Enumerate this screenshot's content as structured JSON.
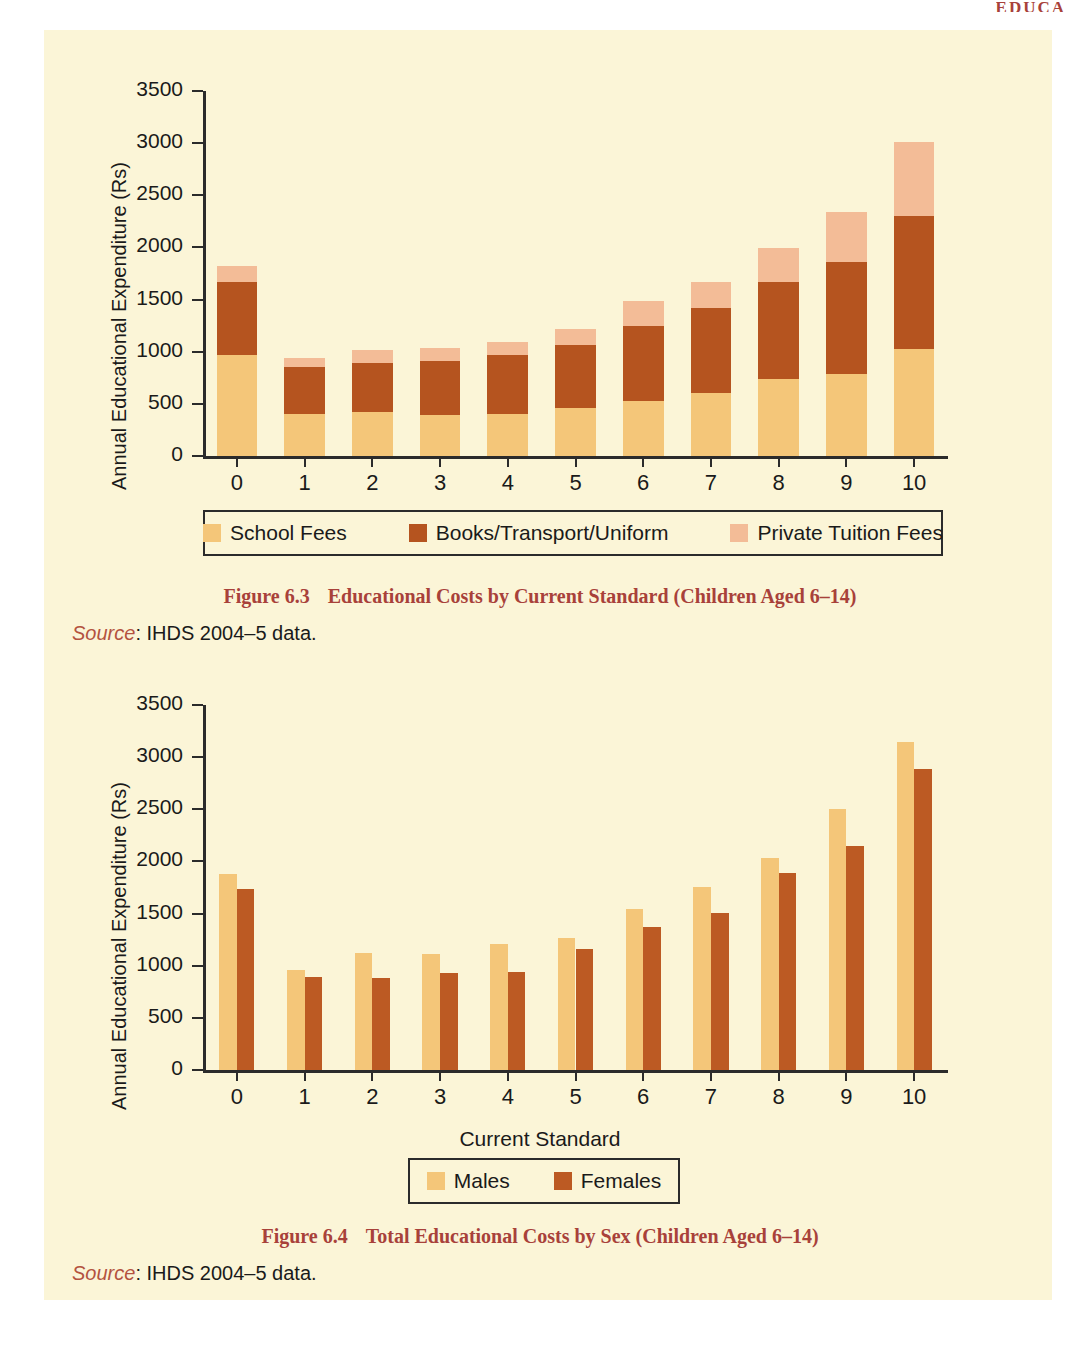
{
  "page": {
    "running_head": "EDUCA",
    "background_color": "#FBF5D7"
  },
  "palette": {
    "school_fees": "#F4C679",
    "books_transport_uniform": "#B5541F",
    "private_tuition_fees": "#F3BC97",
    "males": "#F4C679",
    "females": "#BC5A23",
    "axis": "#2b2b2b",
    "caption": "#A8413A"
  },
  "figure_63": {
    "ylabel": "Annual Educational Expenditure (Rs)",
    "yticks": [
      "0",
      "500",
      "1000",
      "1500",
      "2000",
      "2500",
      "3000",
      "3500"
    ],
    "xticks": [
      "0",
      "1",
      "2",
      "3",
      "4",
      "5",
      "6",
      "7",
      "8",
      "9",
      "10"
    ],
    "legend": [
      {
        "label": "School Fees",
        "color": "#F4C679",
        "key": "school-fees"
      },
      {
        "label": "Books/Transport/Uniform",
        "color": "#B5541F",
        "key": "books-transport-uniform"
      },
      {
        "label": "Private Tuition Fees",
        "color": "#F3BC97",
        "key": "private-tuition-fees"
      }
    ],
    "caption_number": "Figure 6.3",
    "caption_text": "Educational Costs by Current Standard (Children Aged 6–14)",
    "source_word": "Source",
    "source_text": ": IHDS 2004–5 data."
  },
  "figure_64": {
    "ylabel": "Annual Educational Expenditure (Rs)",
    "xlabel": "Current Standard",
    "yticks": [
      "0",
      "500",
      "1000",
      "1500",
      "2000",
      "2500",
      "3000",
      "3500"
    ],
    "xticks": [
      "0",
      "1",
      "2",
      "3",
      "4",
      "5",
      "6",
      "7",
      "8",
      "9",
      "10"
    ],
    "legend": [
      {
        "label": "Males",
        "color": "#F4C679",
        "key": "males"
      },
      {
        "label": "Females",
        "color": "#BC5A23",
        "key": "females"
      }
    ],
    "caption_number": "Figure 6.4",
    "caption_text": "Total Educational Costs by Sex (Children Aged 6–14)",
    "source_word": "Source",
    "source_text": ": IHDS 2004–5 data."
  },
  "chart_data": [
    {
      "id": "figure-6-3",
      "type": "bar",
      "stacked": true,
      "title": "Educational Costs by Current Standard (Children Aged 6–14)",
      "xlabel": "",
      "ylabel": "Annual Educational Expenditure (Rs)",
      "ylim": [
        0,
        3500
      ],
      "ytick_step": 500,
      "grid": false,
      "legend_position": "bottom",
      "categories": [
        "0",
        "1",
        "2",
        "3",
        "4",
        "5",
        "6",
        "7",
        "8",
        "9",
        "10"
      ],
      "series": [
        {
          "name": "School Fees",
          "color": "#F4C679",
          "values": [
            970,
            400,
            420,
            390,
            400,
            465,
            530,
            600,
            740,
            790,
            1030
          ]
        },
        {
          "name": "Books/Transport/Uniform",
          "color": "#B5541F",
          "values": [
            700,
            450,
            475,
            520,
            565,
            600,
            720,
            820,
            930,
            1075,
            1270
          ]
        },
        {
          "name": "Private Tuition Fees",
          "color": "#F3BC97",
          "values": [
            150,
            90,
            125,
            130,
            130,
            155,
            240,
            245,
            320,
            475,
            710
          ]
        }
      ],
      "totals": [
        1820,
        940,
        1020,
        1040,
        1095,
        1220,
        1490,
        1665,
        1990,
        2340,
        3010
      ]
    },
    {
      "id": "figure-6-4",
      "type": "bar",
      "stacked": false,
      "title": "Total Educational Costs by Sex (Children Aged 6–14)",
      "xlabel": "Current Standard",
      "ylabel": "Annual Educational Expenditure (Rs)",
      "ylim": [
        0,
        3500
      ],
      "ytick_step": 500,
      "grid": false,
      "legend_position": "bottom",
      "categories": [
        "0",
        "1",
        "2",
        "3",
        "4",
        "5",
        "6",
        "7",
        "8",
        "9",
        "10"
      ],
      "series": [
        {
          "name": "Males",
          "color": "#F4C679",
          "values": [
            1880,
            960,
            1120,
            1110,
            1210,
            1265,
            1545,
            1755,
            2030,
            2505,
            3145
          ]
        },
        {
          "name": "Females",
          "color": "#BC5A23",
          "values": [
            1740,
            895,
            880,
            930,
            940,
            1165,
            1375,
            1510,
            1890,
            2145,
            2885
          ]
        }
      ]
    }
  ]
}
